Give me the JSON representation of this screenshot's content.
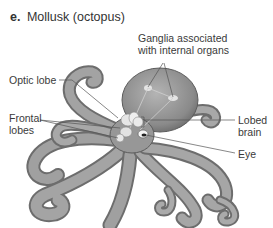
{
  "figure": {
    "panel_letter": "e.",
    "title": "Mollusk (octopus)"
  },
  "labels": {
    "ganglia_line1": "Ganglia associated",
    "ganglia_line2": "with internal organs",
    "optic_lobe": "Optic lobe",
    "frontal_line1": "Frontal",
    "frontal_line2": "lobes",
    "lobed_line1": "Lobed",
    "lobed_line2": "brain",
    "eye": "Eye"
  },
  "colors": {
    "body": "#8f8f8f",
    "body_shade": "#6b6b6b",
    "highlight": "#d8d8d8",
    "leader_line": "#555555",
    "text": "#333333"
  }
}
